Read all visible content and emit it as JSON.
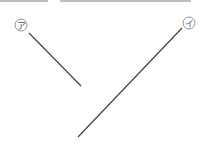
{
  "diagram": {
    "labels": [
      {
        "id": "a",
        "text": "ア",
        "cx": 21,
        "cy": 25
      },
      {
        "id": "i",
        "text": "イ",
        "cx": 189,
        "cy": 23
      }
    ],
    "lines": [
      {
        "id": "line-a",
        "x1": 29,
        "y1": 33,
        "x2": 81,
        "y2": 86
      },
      {
        "id": "line-i",
        "x1": 182,
        "y1": 28,
        "x2": 78,
        "y2": 137
      }
    ],
    "colors": {
      "line": "#444444",
      "circle": "#777777"
    }
  }
}
